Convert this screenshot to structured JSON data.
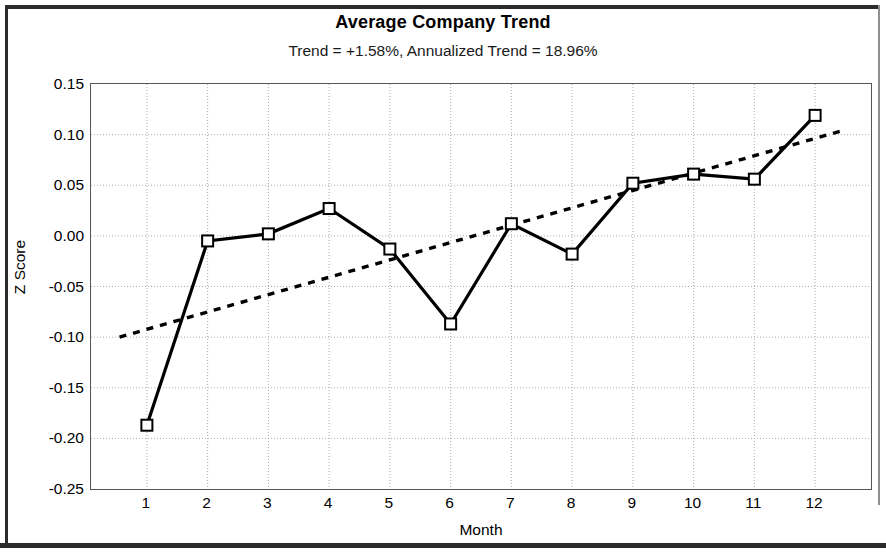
{
  "chart_data": {
    "type": "line",
    "title": "Average Company Trend",
    "subtitle": "Trend = +1.58%,  Annualized Trend =  18.96%",
    "xlabel": "Month",
    "ylabel": "Z Score",
    "categories": [
      "1",
      "2",
      "3",
      "4",
      "5",
      "6",
      "7",
      "8",
      "9",
      "10",
      "11",
      "12"
    ],
    "x": [
      1,
      2,
      3,
      4,
      5,
      6,
      7,
      8,
      9,
      10,
      11,
      12
    ],
    "ylim": [
      -0.25,
      0.15
    ],
    "yticks": [
      0.15,
      0.1,
      0.05,
      0.0,
      -0.05,
      -0.1,
      -0.15,
      -0.2,
      -0.25
    ],
    "ytick_labels": [
      "0.15",
      "0.10",
      "0.05",
      "0.00",
      "-0.05",
      "-0.10",
      "-0.15",
      "-0.20",
      "-0.25"
    ],
    "grid": true,
    "legend": "none",
    "series": [
      {
        "name": "Average Company Trend",
        "style": "solid-line-with-square-markers",
        "color": "#000000",
        "marker": "open-square",
        "values": [
          -0.187,
          -0.005,
          0.002,
          0.027,
          -0.013,
          -0.087,
          0.012,
          -0.018,
          0.052,
          0.061,
          0.056,
          0.119
        ]
      },
      {
        "name": "Linear trendline",
        "style": "dotted-line",
        "color": "#000000",
        "marker": "none",
        "endpoints": {
          "x_start": 0.55,
          "y_start": -0.1,
          "x_end": 12.45,
          "y_end": 0.104
        },
        "slope_per_month": 0.01714
      }
    ]
  }
}
